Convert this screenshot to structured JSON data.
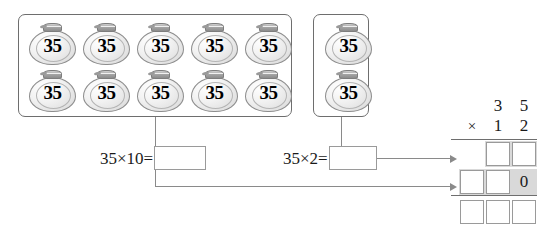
{
  "worksheet": {
    "bag_label": "35",
    "groups": [
      {
        "name": "ten-bags-group",
        "count": 10,
        "rows": [
          [
            "35",
            "35",
            "35",
            "35",
            "35"
          ],
          [
            "35",
            "35",
            "35",
            "35",
            "35"
          ]
        ]
      },
      {
        "name": "two-bags-group",
        "count": 2,
        "rows": [
          [
            "35"
          ],
          [
            "35"
          ]
        ]
      }
    ],
    "equations": [
      {
        "name": "times-ten",
        "expression": "35×10=",
        "answer": ""
      },
      {
        "name": "times-two",
        "expression": "35×2=",
        "answer": ""
      }
    ],
    "vertical_multiplication": {
      "multiplicand": [
        "3",
        "5"
      ],
      "operator": "×",
      "multiplier": [
        "1",
        "2"
      ],
      "partial_product_first": [
        "",
        ""
      ],
      "partial_product_second": [
        "",
        "",
        "0"
      ],
      "total": [
        "",
        "",
        ""
      ]
    },
    "colors": {
      "box_border": "#6e6e6e",
      "cell_border": "#9a9a9a",
      "highlight": "#d9d9d9",
      "line": "#8a8a8a",
      "text": "#1a1a1a"
    }
  }
}
